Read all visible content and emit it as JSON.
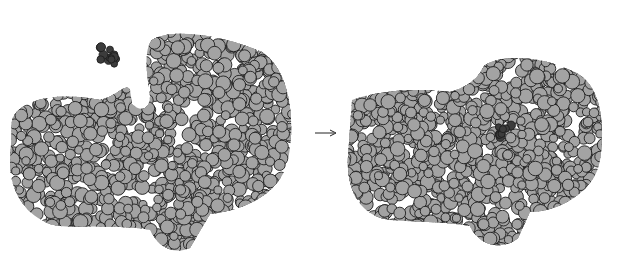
{
  "figure": {
    "left_panel": {
      "label": "enzyme-and-substrate-separate"
    },
    "arrow": {
      "symbol": "→"
    },
    "right_panel": {
      "label": "enzyme-substrate-complex"
    },
    "colors": {
      "atom_fill": "#a3a3a3",
      "atom_stroke": "#1e1e1e",
      "substrate_fill": "#3c3c3c",
      "background": "#ffffff"
    }
  }
}
